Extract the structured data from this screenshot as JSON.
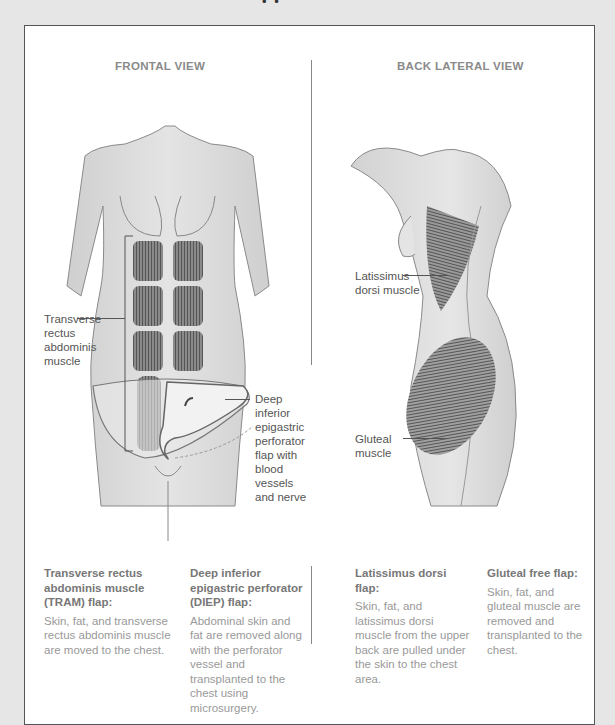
{
  "header": {
    "cut_off_text": "• •"
  },
  "frontal_view": {
    "title": "FRONTAL VIEW",
    "labels": {
      "tram_muscle": [
        "Transverse",
        "rectus",
        "abdominis",
        "muscle"
      ],
      "diep_flap": [
        "Deep",
        "inferior",
        "epigastric",
        "perforator",
        "flap with",
        "blood",
        "vessels",
        "and nerve"
      ]
    }
  },
  "back_lateral_view": {
    "title": "BACK LATERAL VIEW",
    "labels": {
      "latissimus": [
        "Latissimus",
        "dorsi muscle"
      ],
      "gluteal": [
        "Gluteal",
        "muscle"
      ]
    }
  },
  "captions": [
    {
      "title": "Transverse rectus abdominis muscle (TRAM) flap:",
      "body": "Skin, fat, and transverse rectus abdominis muscle are moved to the chest."
    },
    {
      "title": "Deep inferior epigastric perforator (DIEP) flap:",
      "body": "Abdominal skin and fat are removed along with the perforator vessel and transplanted to the chest using microsurgery."
    },
    {
      "title": "Latissimus dorsi flap:",
      "body": "Skin, fat, and latissimus dorsi muscle from the upper back are pulled under the skin to the chest area."
    },
    {
      "title": "Gluteal free flap:",
      "body": "Skin, fat, and gluteal muscle are removed and transplanted to the chest."
    }
  ],
  "colors": {
    "background": "#e6e6e6",
    "panel_border": "#555555",
    "title_text": "#8a8a8a",
    "caption_title": "#777777",
    "caption_body": "#999999",
    "skin": "#dcdcdc",
    "muscle": "#6a6a6a"
  }
}
